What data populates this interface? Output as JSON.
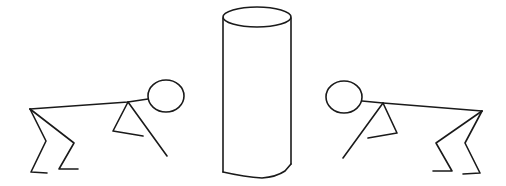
{
  "scene": {
    "description": "Two stick figures bent forward on either side of a tall cylinder",
    "background": "#ffffff",
    "stroke_color": "#1a1a1a",
    "elements": [
      "left-stick-figure",
      "cylinder",
      "right-stick-figure"
    ]
  }
}
